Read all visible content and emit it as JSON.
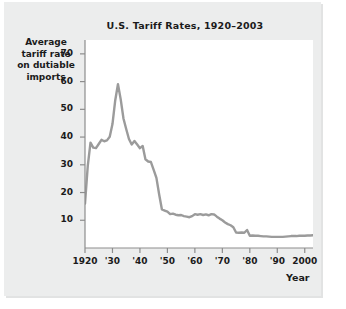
{
  "chart_data": {
    "type": "line",
    "title": "U.S. Tariff Rates, 1920–2003",
    "xlabel": "Year",
    "ylabel": "Average tariff rate on dutiable imports",
    "ylabel_lines": [
      "Average",
      "tariff rate",
      "on dutiable",
      "imports"
    ],
    "xlim": [
      1920,
      2003
    ],
    "ylim": [
      0,
      75
    ],
    "grid": false,
    "legend": null,
    "line_color": "#9b9b9b",
    "plot_background": "#ffffff",
    "panel_background": "#eceded",
    "ytick_values": [
      70,
      60,
      50,
      40,
      30,
      20,
      10
    ],
    "ytick_labels": [
      "70",
      "60",
      "50",
      "40",
      "30",
      "20",
      "10"
    ],
    "xtick_values": [
      1920,
      1930,
      1940,
      1950,
      1960,
      1970,
      1980,
      1990,
      2000
    ],
    "xtick_labels": [
      "1920",
      "'30",
      "'40",
      "'50",
      "'60",
      "'70",
      "'80",
      "'90",
      "2000"
    ],
    "x": [
      1920,
      1921,
      1922,
      1923,
      1924,
      1925,
      1926,
      1927,
      1928,
      1929,
      1930,
      1931,
      1932,
      1933,
      1934,
      1935,
      1936,
      1937,
      1938,
      1939,
      1940,
      1941,
      1942,
      1943,
      1944,
      1945,
      1946,
      1947,
      1948,
      1949,
      1950,
      1951,
      1952,
      1953,
      1954,
      1955,
      1956,
      1957,
      1958,
      1959,
      1960,
      1961,
      1962,
      1963,
      1964,
      1965,
      1966,
      1967,
      1968,
      1969,
      1970,
      1971,
      1972,
      1973,
      1974,
      1975,
      1976,
      1977,
      1978,
      1979,
      1980,
      1981,
      1982,
      1983,
      1984,
      1985,
      1986,
      1987,
      1988,
      1989,
      1990,
      1991,
      1992,
      1993,
      1994,
      1995,
      1996,
      1997,
      1998,
      1999,
      2000,
      2001,
      2002,
      2003
    ],
    "values": [
      16.0,
      29.5,
      38.0,
      36.2,
      36.0,
      37.5,
      39.0,
      38.5,
      38.8,
      40.1,
      44.7,
      53.2,
      59.1,
      53.6,
      46.7,
      42.9,
      39.3,
      37.3,
      38.6,
      37.3,
      36.0,
      36.8,
      32.0,
      31.2,
      31.0,
      28.2,
      25.3,
      19.3,
      13.9,
      13.5,
      13.1,
      12.2,
      12.4,
      12.0,
      11.8,
      11.9,
      11.5,
      11.3,
      11.1,
      11.5,
      12.2,
      12.0,
      12.2,
      11.9,
      12.1,
      11.8,
      12.2,
      12.1,
      11.3,
      10.6,
      10.0,
      9.2,
      8.6,
      8.2,
      7.5,
      5.6,
      5.5,
      5.6,
      5.5,
      6.5,
      4.4,
      4.5,
      4.4,
      4.4,
      4.3,
      4.2,
      4.2,
      4.1,
      4.0,
      4.0,
      4.0,
      4.0,
      4.0,
      4.1,
      4.2,
      4.3,
      4.3,
      4.3,
      4.4,
      4.4,
      4.4,
      4.5,
      4.5,
      4.6
    ],
    "annotations": []
  },
  "axis": {
    "year_label": "Year"
  }
}
